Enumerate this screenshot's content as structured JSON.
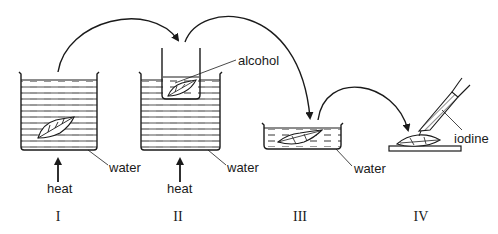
{
  "diagram": {
    "type": "process",
    "steps": [
      {
        "id": "step-1",
        "numeral": "I",
        "labels": {
          "heat": "heat",
          "liquid": "water"
        }
      },
      {
        "id": "step-2",
        "numeral": "II",
        "labels": {
          "heat": "heat",
          "liquid": "water",
          "inner_liquid": "alcohol"
        }
      },
      {
        "id": "step-3",
        "numeral": "III",
        "labels": {
          "liquid": "water"
        }
      },
      {
        "id": "step-4",
        "numeral": "IV",
        "labels": {
          "reagent": "iodine"
        }
      }
    ],
    "connections": [
      {
        "from": "I",
        "to": "II"
      },
      {
        "from": "II",
        "to": "III"
      },
      {
        "from": "III",
        "to": "IV"
      }
    ],
    "colors": {
      "ink": "#1a1a1a",
      "background": "#ffffff"
    }
  }
}
